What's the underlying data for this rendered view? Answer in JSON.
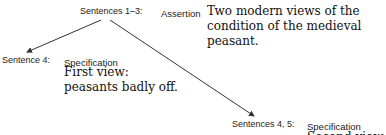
{
  "diagram": {
    "type": "rhetorical-structure-tree",
    "nodes": [
      {
        "id": "root",
        "sentences": "Sentences 1–3:",
        "role": "Assertion",
        "content": [
          "Two modern views of the",
          "condition of the medieval",
          "peasant."
        ]
      },
      {
        "id": "child1",
        "sentences": "Sentence 4:",
        "role": "Specification",
        "content": [
          "First view:",
          "peasants badly off."
        ]
      },
      {
        "id": "child2",
        "sentences": "Sentences 4, 5:",
        "role": "Specification",
        "content": [
          "Second view"
        ]
      }
    ],
    "edges": [
      {
        "from": "root",
        "to": "child1"
      },
      {
        "from": "root",
        "to": "child2"
      }
    ]
  }
}
